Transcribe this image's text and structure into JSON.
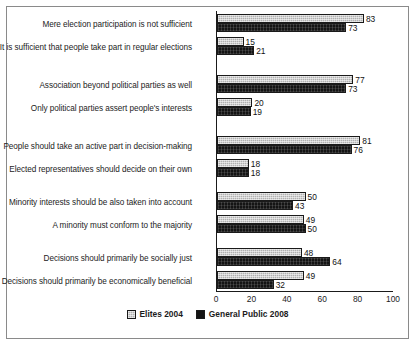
{
  "chart_data": {
    "type": "bar",
    "orientation": "horizontal",
    "title": "",
    "xlabel": "",
    "ylabel": "",
    "xlim": [
      0,
      100
    ],
    "xticks": [
      0,
      20,
      40,
      60,
      80,
      100
    ],
    "grid": false,
    "legend_position": "bottom-center",
    "series": [
      {
        "name": "Elites 2004",
        "color": "#b0b0b0",
        "values": [
          83,
          15,
          77,
          20,
          81,
          18,
          50,
          49,
          48,
          49
        ]
      },
      {
        "name": "General Public 2008",
        "color": "#141414",
        "values": [
          73,
          21,
          73,
          19,
          76,
          18,
          43,
          50,
          64,
          32
        ]
      }
    ],
    "categories": [
      "Mere election participation is not sufficient",
      "It is sufficient that people take part in regular elections",
      "Association beyond political parties as well",
      "Only political parties assert people's interests",
      "People should take an active part in decision-making",
      "Elected representatives should decide on their own",
      "Minority interests should be also taken into account",
      "A minority must conform to the majority",
      "Decisions should primarily be socially just",
      "Decisions should primarily be economically beneficial"
    ],
    "groups": [
      {
        "rows": [
          {
            "label": "Mere election participation is not sufficient",
            "elites": 83,
            "public": 73
          },
          {
            "label": "It is sufficient that people take part in regular elections",
            "elites": 15,
            "public": 21
          }
        ]
      },
      {
        "rows": [
          {
            "label": "Association beyond political parties as well",
            "elites": 77,
            "public": 73
          },
          {
            "label": "Only political parties assert people's interests",
            "elites": 20,
            "public": 19
          }
        ]
      },
      {
        "rows": [
          {
            "label": "People should take an active part in decision-making",
            "elites": 81,
            "public": 76
          },
          {
            "label": "Elected representatives should decide on their own",
            "elites": 18,
            "public": 18
          }
        ]
      },
      {
        "rows": [
          {
            "label": "Minority interests should be also taken into account",
            "elites": 50,
            "public": 43
          },
          {
            "label": "A minority must conform to the majority",
            "elites": 49,
            "public": 50
          }
        ]
      },
      {
        "rows": [
          {
            "label": "Decisions should primarily be socially just",
            "elites": 48,
            "public": 64
          },
          {
            "label": "Decisions should primarily be economically beneficial",
            "elites": 49,
            "public": 32
          }
        ]
      }
    ]
  },
  "axis": {
    "ticks": [
      "0",
      "20",
      "40",
      "60",
      "80",
      "100"
    ]
  },
  "legend": {
    "entries": [
      {
        "label": "Elites 2004"
      },
      {
        "label": "General Public 2008"
      }
    ]
  }
}
